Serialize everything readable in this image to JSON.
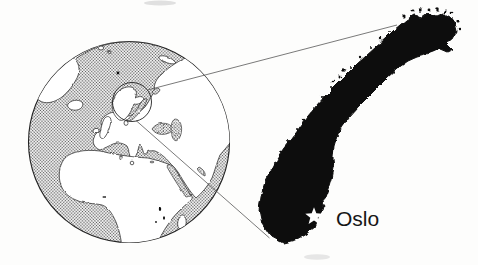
{
  "map": {
    "type": "locator-map",
    "city_label": "Oslo",
    "marker": "star",
    "highlighted_country_silhouette": "Norway",
    "globe_view": "Europe and Africa with circle highlight around Scandinavia",
    "colors": {
      "background": "#fdfdfc",
      "country_silhouette": "#111111",
      "ocean_stipple_dot": "#555555",
      "land": "#ffffff",
      "coastline": "#1c1c1c",
      "projection_line": "#4d4d4d",
      "label_text": "#161616",
      "star_marker": "#ffffff"
    }
  }
}
